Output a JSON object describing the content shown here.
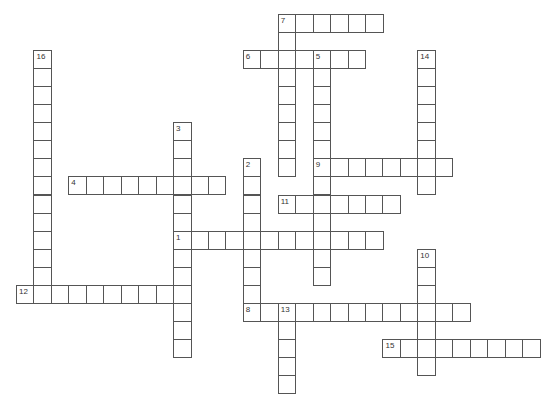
{
  "puzzle": {
    "type": "crossword",
    "grid": {
      "origin_x": 16,
      "origin_y": 14,
      "cell_w": 17.45,
      "cell_h": 18.05,
      "border_color": "#555555"
    },
    "entries": [
      {
        "number": "1",
        "direction": "across",
        "row": 12,
        "col": 9,
        "length": 12
      },
      {
        "number": "2",
        "direction": "down",
        "row": 8,
        "col": 13,
        "length": 9
      },
      {
        "number": "3",
        "direction": "down",
        "row": 6,
        "col": 9,
        "length": 13
      },
      {
        "number": "4",
        "direction": "across",
        "row": 9,
        "col": 3,
        "length": 9
      },
      {
        "number": "5",
        "direction": "down",
        "row": 2,
        "col": 17,
        "length": 13
      },
      {
        "number": "6",
        "direction": "across",
        "row": 2,
        "col": 13,
        "length": 7
      },
      {
        "number": "7",
        "direction": "across",
        "row": 0,
        "col": 15,
        "length": 6
      },
      {
        "number": "7",
        "direction": "down",
        "row": 0,
        "col": 15,
        "length": 9
      },
      {
        "number": "8",
        "direction": "across",
        "row": 16,
        "col": 13,
        "length": 13
      },
      {
        "number": "9",
        "direction": "across",
        "row": 8,
        "col": 17,
        "length": 8
      },
      {
        "number": "10",
        "direction": "down",
        "row": 13,
        "col": 23,
        "length": 7
      },
      {
        "number": "11",
        "direction": "across",
        "row": 10,
        "col": 15,
        "length": 7
      },
      {
        "number": "12",
        "direction": "across",
        "row": 15,
        "col": 0,
        "length": 10
      },
      {
        "number": "13",
        "direction": "down",
        "row": 16,
        "col": 15,
        "length": 5
      },
      {
        "number": "14",
        "direction": "down",
        "row": 2,
        "col": 23,
        "length": 8
      },
      {
        "number": "15",
        "direction": "across",
        "row": 18,
        "col": 21,
        "length": 9
      },
      {
        "number": "16",
        "direction": "down",
        "row": 2,
        "col": 1,
        "length": 14
      }
    ]
  }
}
